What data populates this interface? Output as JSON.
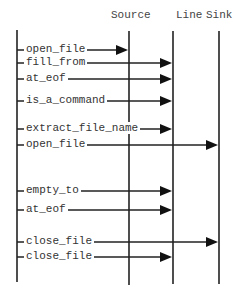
{
  "headers": {
    "source": "Source",
    "line": "Line",
    "sink": "Sink"
  },
  "lifelines": [
    {
      "name": "caller",
      "x": 17,
      "y1": 30,
      "y2": 282
    },
    {
      "name": "source",
      "x": 129,
      "y1": 31,
      "y2": 285
    },
    {
      "name": "line",
      "x": 173,
      "y1": 31,
      "y2": 284
    },
    {
      "name": "sink",
      "x": 219,
      "y1": 31,
      "y2": 284
    }
  ],
  "messages": [
    {
      "label": "open_file",
      "y": 50,
      "target": "source"
    },
    {
      "label": "fill_from",
      "y": 63,
      "target": "line"
    },
    {
      "label": "at_eof",
      "y": 79,
      "target": "line"
    },
    {
      "label": "is_a_command",
      "y": 101,
      "target": "line"
    },
    {
      "label": "extract_file_name",
      "y": 129,
      "target": "line"
    },
    {
      "label": "open_file",
      "y": 145,
      "target": "sink"
    },
    {
      "label": "empty_to",
      "y": 191,
      "target": "line"
    },
    {
      "label": "at_eof",
      "y": 210,
      "target": "line"
    },
    {
      "label": "close_file",
      "y": 242,
      "target": "sink"
    },
    {
      "label": "close_file",
      "y": 257,
      "target": "line"
    }
  ]
}
